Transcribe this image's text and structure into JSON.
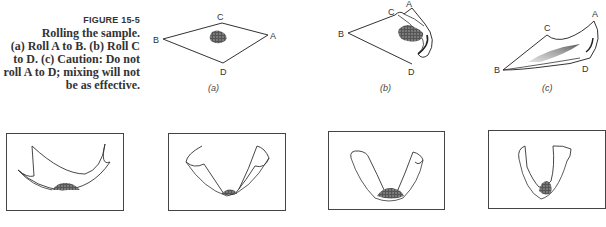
{
  "caption": {
    "figure_number": "FIGURE 15-5",
    "lines": [
      "Rolling the sample.",
      "(a) Roll A to B. (b) Roll C",
      "to D. (c) Caution: Do not",
      "roll A to D; mixing will not",
      "be as effective."
    ]
  },
  "top_panels": [
    {
      "label": "(a)",
      "corners": {
        "A": "A",
        "B": "B",
        "C": "C",
        "D": "D"
      }
    },
    {
      "label": "(b)",
      "corners": {
        "A": "A",
        "B": "B",
        "C": "C",
        "D": "D"
      }
    },
    {
      "label": "(c)",
      "corners": {
        "A": "A",
        "B": "B",
        "C": "C",
        "D": "D"
      }
    }
  ],
  "bottom_panels": [
    {
      "name": "stage-1"
    },
    {
      "name": "stage-2"
    },
    {
      "name": "stage-3"
    },
    {
      "name": "stage-4"
    }
  ],
  "colors": {
    "ink": "#333333",
    "sample": "#2a2a2a"
  }
}
